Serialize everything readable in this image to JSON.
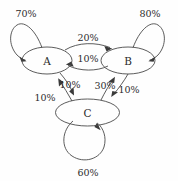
{
  "diagram": {
    "type": "state-transition-graph",
    "background_color": "#fefefe",
    "stroke_color": "#4a4a4a",
    "text_color": "#2b2b2b",
    "nodes": [
      {
        "id": "A",
        "label": "A",
        "cx": 47,
        "cy": 60.5,
        "rx": 25,
        "ry": 13.5
      },
      {
        "id": "B",
        "label": "B",
        "cx": 128,
        "cy": 60.5,
        "rx": 27,
        "ry": 13.5
      },
      {
        "id": "C",
        "label": "C",
        "cx": 87.5,
        "cy": 112.5,
        "rx": 32,
        "ry": 13.5
      }
    ],
    "edges": [
      {
        "id": "A-A",
        "from": "A",
        "to": "A",
        "label": "70%",
        "kind": "self-loop",
        "label_x": 26,
        "label_y": 13
      },
      {
        "id": "B-B",
        "from": "B",
        "to": "B",
        "label": "80%",
        "kind": "self-loop",
        "label_x": 150,
        "label_y": 13
      },
      {
        "id": "C-C",
        "from": "C",
        "to": "C",
        "label": "60%",
        "kind": "self-loop",
        "label_x": 88,
        "label_y": 172
      },
      {
        "id": "A-B",
        "from": "A",
        "to": "B",
        "label": "20%",
        "kind": "arc-top",
        "label_x": 88,
        "label_y": 37
      },
      {
        "id": "B-A",
        "from": "B",
        "to": "A",
        "label": "10%",
        "kind": "arc-bottom",
        "label_x": 88,
        "label_y": 58
      },
      {
        "id": "A-C",
        "from": "A",
        "to": "C",
        "label": "10%",
        "kind": "straight",
        "label_x": 45,
        "label_y": 97
      },
      {
        "id": "C-A",
        "from": "C",
        "to": "A",
        "label": "10%",
        "kind": "straight",
        "label_x": 70,
        "label_y": 84
      },
      {
        "id": "C-B",
        "from": "C",
        "to": "B",
        "label": "30%",
        "kind": "straight",
        "label_x": 105,
        "label_y": 85
      },
      {
        "id": "B-C",
        "from": "B",
        "to": "C",
        "label": "10%",
        "kind": "straight",
        "label_x": 129,
        "label_y": 89
      }
    ]
  }
}
